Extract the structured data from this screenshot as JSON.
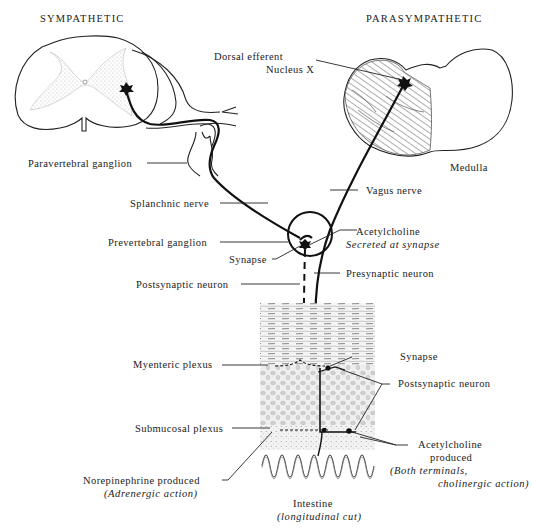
{
  "headers": {
    "sympathetic": "SYMPATHETIC",
    "parasympathetic": "PARASYMPATHETIC"
  },
  "labels": {
    "dorsal_efferent_line1": "Dorsal efferent",
    "dorsal_efferent_line2": "Nucleus X",
    "medulla": "Medulla",
    "paravertebral_ganglion": "Paravertebral ganglion",
    "vagus_nerve": "Vagus nerve",
    "splanchnic_nerve": "Splanchnic nerve",
    "acetylcholine": "Acetylcholine",
    "secreted_at_synapse": "Secreted at synapse",
    "prevertebral_ganglion": "Prevertebral ganglion",
    "synapse_upper": "Synapse",
    "presynaptic_neuron": "Presynaptic neuron",
    "postsynaptic_neuron_left": "Postsynaptic neuron",
    "myenteric_plexus": "Myenteric plexus",
    "synapse_lower": "Synapse",
    "postsynaptic_neuron_right": "Postsynaptic neuron",
    "submucosal_plexus": "Submucosal plexus",
    "acetylcholine_produced_line1": "Acetylcholine",
    "acetylcholine_produced_line2": "produced",
    "both_terminals": "(Both terminals,",
    "cholinergic_action": "cholinergic action)",
    "norepinephrine_produced": "Norepinephrine produced",
    "adrenergic_action": "(Adrenergic action)",
    "intestine": "Intestine",
    "longitudinal_cut": "(longitudinal cut)"
  },
  "colors": {
    "ink": "#1a1a1a",
    "gray_matter": "#d9d9d9",
    "tissue_shade": "#bdbdbd",
    "background": "#ffffff"
  }
}
